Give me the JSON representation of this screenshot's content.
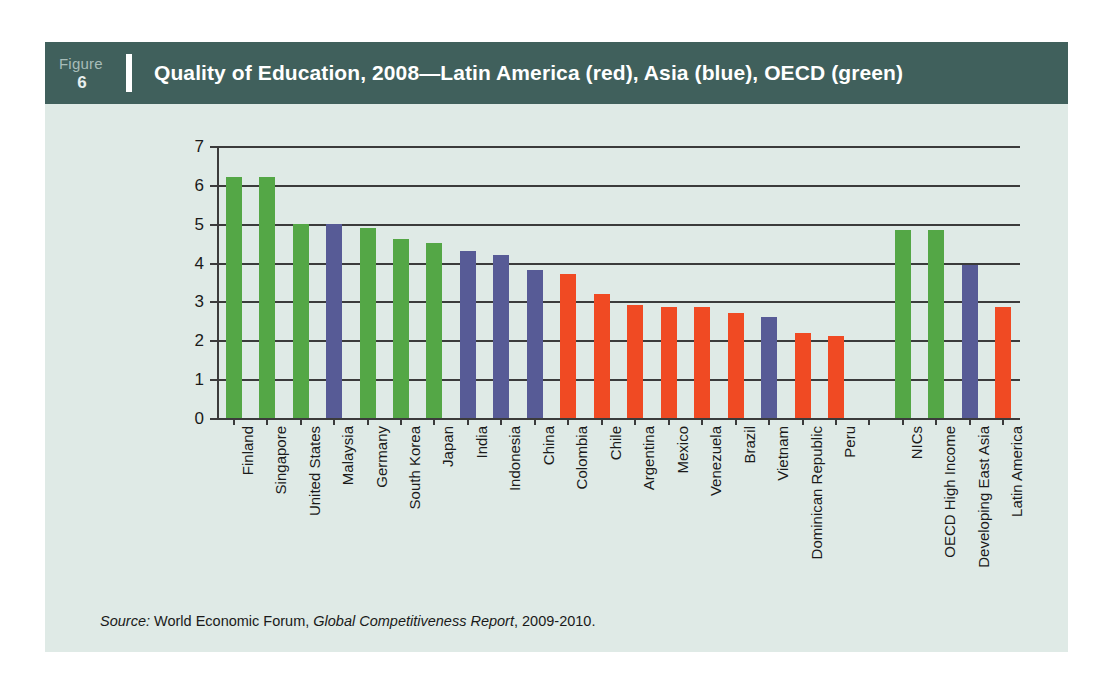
{
  "figure": {
    "word": "Figure",
    "number": "6",
    "title": "Quality of Education, 2008—Latin America (red), Asia (blue), OECD (green)"
  },
  "source": {
    "label": "Source:",
    "organization": "World Economic Forum,",
    "publication": "Global Competitiveness Report",
    "years": ", 2009-2010."
  },
  "colors": {
    "header_bg": "#40605c",
    "panel_bg": "#dfeae6",
    "page_bg": "#ffffff",
    "latin_america_red": "#f04a23",
    "asia_blue": "#575b96",
    "oecd_green": "#54a746",
    "axis": "#3b3b3b",
    "title_text": "#ffffff",
    "figure_number_text": "#a8bdb9"
  },
  "chart_data": {
    "type": "bar",
    "title": "Quality of Education, 2008—Latin America (red), Asia (blue), OECD (green)",
    "xlabel": "",
    "ylabel": "",
    "ylim": [
      0,
      7
    ],
    "yticks": [
      0,
      1,
      2,
      3,
      4,
      5,
      6,
      7
    ],
    "ytick_labels": [
      "0",
      "1",
      "2",
      "3",
      "4",
      "5",
      "6",
      "7"
    ],
    "grid": true,
    "legend_position": "in-title",
    "legend": [
      {
        "name": "Latin America",
        "color": "#f04a23"
      },
      {
        "name": "Asia",
        "color": "#575b96"
      },
      {
        "name": "OECD",
        "color": "#54a746"
      }
    ],
    "categories": [
      "Finland",
      "Singapore",
      "United States",
      "Malaysia",
      "Germany",
      "South Korea",
      "Japan",
      "India",
      "Indonesia",
      "China",
      "Colombia",
      "Chile",
      "Argentina",
      "Mexico",
      "Venezuela",
      "Brazil",
      "Vietnam",
      "Dominican Republic",
      "Peru",
      "",
      "NICs",
      "OECD High Income",
      "Developing East Asia",
      "Latin America"
    ],
    "values": [
      6.2,
      6.2,
      5.0,
      5.0,
      4.9,
      4.6,
      4.5,
      4.3,
      4.2,
      3.8,
      3.7,
      3.2,
      2.9,
      2.85,
      2.85,
      2.7,
      2.6,
      2.2,
      2.1,
      null,
      4.85,
      4.85,
      3.95,
      2.85
    ],
    "groups": [
      "OECD",
      "OECD",
      "OECD",
      "Asia",
      "OECD",
      "OECD",
      "OECD",
      "Asia",
      "Asia",
      "Asia",
      "Latin America",
      "Latin America",
      "Latin America",
      "Latin America",
      "Latin America",
      "Latin America",
      "Asia",
      "Latin America",
      "Latin America",
      "gap",
      "OECD",
      "OECD",
      "Asia",
      "Latin America"
    ]
  }
}
